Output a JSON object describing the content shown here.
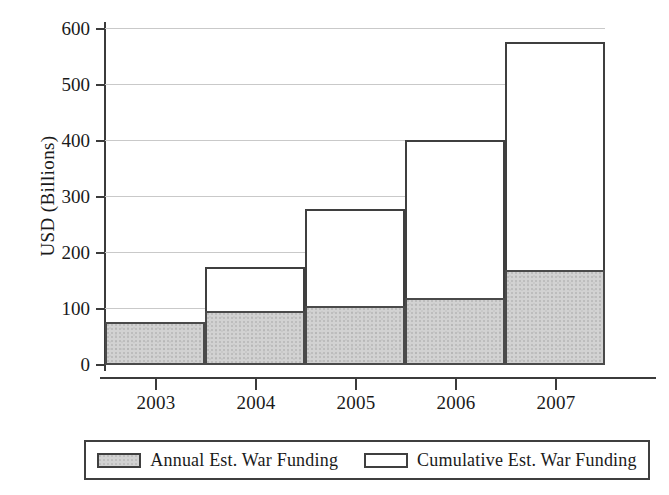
{
  "chart_data": {
    "type": "bar",
    "title": "",
    "subtitle": "",
    "xlabel": "",
    "ylabel": "USD (Billions)",
    "categories": [
      "2003",
      "2004",
      "2005",
      "2006",
      "2007"
    ],
    "series": [
      {
        "name": "Annual Est. War Funding",
        "values": [
          76,
          96,
          105,
          120,
          170
        ],
        "fill": "#d2d2d2",
        "stroke": "#4a4a4a",
        "style": "shaded"
      },
      {
        "name": "Cumulative Est. War Funding",
        "values": [
          76,
          175,
          277,
          400,
          575
        ],
        "fill": "#ffffff",
        "stroke": "#3f3f3f",
        "style": "hollow"
      }
    ],
    "ylim": [
      0,
      600
    ],
    "yticks": [
      "0",
      "100",
      "200",
      "300",
      "400",
      "500",
      "600"
    ],
    "ytick_values": [
      0,
      100,
      200,
      300,
      400,
      500,
      600
    ],
    "grid": true,
    "grid_axis": "y",
    "grid_color": "#c9c9c9",
    "legend_position": "bottom",
    "bar_gap": 0,
    "overlay": "annual drawn in front of cumulative, sharing baseline"
  },
  "axes": {
    "y_title": "USD (Billions)",
    "tick_labels_y": [
      "600",
      "500",
      "400",
      "300",
      "200",
      "100",
      "0"
    ],
    "tick_labels_x": [
      "2003",
      "2004",
      "2005",
      "2006",
      "2007"
    ]
  },
  "legend": {
    "entries": [
      {
        "label": "Annual Est. War Funding",
        "swatch": "filled-gray-rect-icon"
      },
      {
        "label": "Cumulative Est. War Funding",
        "swatch": "hollow-white-rect-icon"
      }
    ]
  },
  "colors": {
    "annual_fill": "#d2d2d2",
    "cumulative_fill": "#ffffff",
    "stroke": "#3f3f3f",
    "grid": "#c9c9c9",
    "text": "#1a1a1a",
    "background": "#ffffff"
  }
}
